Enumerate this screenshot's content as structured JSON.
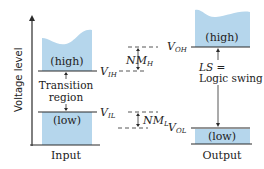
{
  "diagram": {
    "y_axis_label": "Voltage level",
    "colors": {
      "region_fill": "#b5d6ec",
      "line": "#2b2b2b",
      "text": "#222222"
    },
    "input": {
      "caption": "Input",
      "high_label": "(high)",
      "low_label": "(low)",
      "transition_line1": "Transition",
      "transition_line2": "region",
      "vih": {
        "main": "V",
        "sub": "IH"
      },
      "vil": {
        "main": "V",
        "sub": "IL"
      }
    },
    "margins": {
      "nmh": {
        "main": "NM",
        "sub": "H"
      },
      "nml": {
        "main": "NM",
        "sub": "L"
      }
    },
    "output": {
      "caption": "Output",
      "high_label": "(high)",
      "low_label": "(low)",
      "ls_line1": "LS =",
      "ls_line2": "Logic swing",
      "voh": {
        "main": "V",
        "sub": "OH"
      },
      "vol": {
        "main": "V",
        "sub": "OL"
      }
    }
  }
}
